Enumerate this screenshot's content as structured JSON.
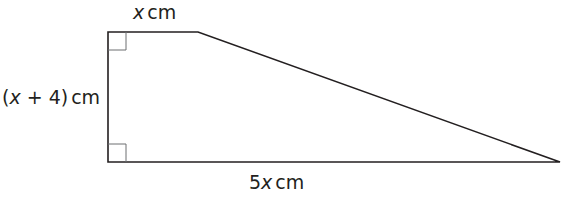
{
  "diagram": {
    "type": "right trapezium",
    "labels": {
      "top": {
        "var": "x",
        "unit": "cm"
      },
      "left": {
        "open": "(",
        "var": "x",
        "rest": " + 4)",
        "unit": "cm"
      },
      "bottom": {
        "coef": "5",
        "var": "x",
        "unit": "cm"
      }
    },
    "right_angles": [
      "top-left",
      "bottom-left"
    ],
    "stroke_color": "#231f20",
    "marker_color": "#6d6e71"
  }
}
